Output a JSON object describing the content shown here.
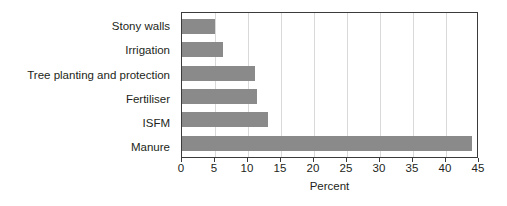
{
  "chart_data": {
    "type": "bar",
    "orientation": "horizontal",
    "title": "",
    "subtitle": "",
    "xlabel": "Percent",
    "ylabel": "",
    "categories": [
      "Stony walls",
      "Irrigation",
      "Tree planting and protection",
      "Fertiliser",
      "ISFM",
      "Manure"
    ],
    "values": [
      5,
      6.2,
      11,
      11.3,
      13,
      44
    ],
    "xlim": [
      0,
      45
    ],
    "xticks": [
      0,
      5,
      10,
      15,
      20,
      25,
      30,
      35,
      40,
      45
    ],
    "xtick_labels": [
      "0",
      "5",
      "10",
      "15",
      "20",
      "25",
      "30",
      "35",
      "40",
      "45"
    ],
    "grid": true,
    "grid_axis": "x",
    "legend": false,
    "legend_position": "none",
    "bar_color": "#8a8a8a",
    "grid_color": "#d9d9d9",
    "axis_color": "#3b3b3b",
    "text_color": "#231f20",
    "background": "#ffffff"
  }
}
